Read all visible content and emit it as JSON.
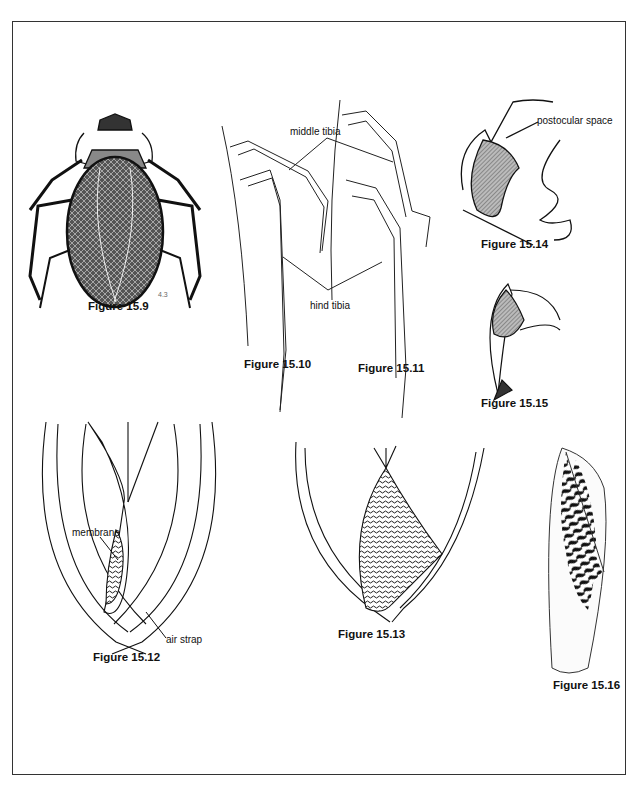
{
  "figures": [
    {
      "id": "15.9",
      "caption": "Figure 15.9",
      "subject": "giant water bug dorsal view"
    },
    {
      "id": "15.10",
      "caption": "Figure 15.10",
      "subject": "middle and hind legs"
    },
    {
      "id": "15.11",
      "caption": "Figure 15.11",
      "subject": "middle and hind legs"
    },
    {
      "id": "15.12",
      "caption": "Figure 15.12",
      "subject": "wing tips with membrane and air strap"
    },
    {
      "id": "15.13",
      "caption": "Figure 15.13",
      "subject": "wing tips with membrane"
    },
    {
      "id": "15.14",
      "caption": "Figure 15.14",
      "subject": "head with eye and postocular space"
    },
    {
      "id": "15.15",
      "caption": "Figure 15.15",
      "subject": "head lateral view"
    },
    {
      "id": "15.16",
      "caption": "Figure 15.16",
      "subject": "hemelytron pattern"
    }
  ],
  "labels": {
    "middle_tibia": "middle tibia",
    "hind_tibia": "hind tibia",
    "postocular_space": "postocular space",
    "membrane": "membrane",
    "air_strap": "air strap"
  },
  "signature": "4.3"
}
